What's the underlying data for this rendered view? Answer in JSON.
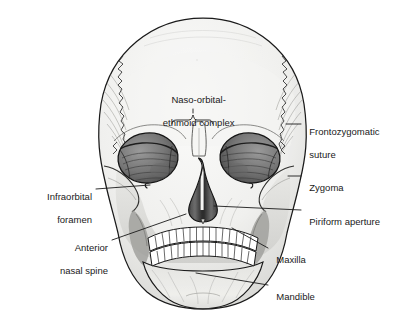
{
  "figure": {
    "style": "greyscale pen-and-ink medical illustration",
    "background_color": "#ffffff",
    "ink_color": "#1a1a1a",
    "palette": {
      "cranium_fill": "#f2f2f0",
      "midface_fill": "#dcdcda",
      "shadow_fill": "#b8b8b6",
      "orbit_fill": "#7d7d7d",
      "orbit_deep": "#4a4a4a",
      "nasal_aperture_fill": "#3f3f3f",
      "tooth_fill": "#ffffff",
      "outline": "#1a1a1a",
      "leader_line": "#1a1a1a"
    }
  },
  "labels": [
    {
      "id": "naso-orbital-ethmoid-complex",
      "text_line1": "Naso-orbital-",
      "text_line2": "ethmoid complex",
      "side": "top",
      "align": "c",
      "x": 196,
      "y": 88,
      "pointer": "curly-brace",
      "brace": {
        "x1": 172,
        "x2": 213,
        "y": 122,
        "stem_y": 115
      }
    },
    {
      "id": "frontozygomatic-suture",
      "text_line1": "Frontozygomatic",
      "text_line2": "suture",
      "side": "right",
      "align": "r",
      "x": 305,
      "y": 120,
      "leader": {
        "x1": 286,
        "y1": 124,
        "x2": 301,
        "y2": 124
      }
    },
    {
      "id": "zygoma",
      "text_line1": "Zygoma",
      "text_line2": "",
      "side": "right",
      "align": "r",
      "x": 305,
      "y": 172,
      "leader": {
        "x1": 288,
        "y1": 176,
        "x2": 301,
        "y2": 176
      }
    },
    {
      "id": "piriform-aperture",
      "text_line1": "Piriform aperture",
      "text_line2": "",
      "side": "right",
      "align": "r",
      "x": 305,
      "y": 206,
      "leader": {
        "x1": 214,
        "y1": 206,
        "x2": 301,
        "y2": 210
      }
    },
    {
      "id": "maxilla",
      "text_line1": "Maxilla",
      "text_line2": "",
      "side": "right",
      "align": "r",
      "x": 272,
      "y": 244,
      "leader": {
        "x1": 232,
        "y1": 228,
        "x2": 268,
        "y2": 248
      }
    },
    {
      "id": "mandible",
      "text_line1": "Mandible",
      "text_line2": "",
      "side": "right",
      "align": "r",
      "x": 272,
      "y": 281,
      "leader": {
        "x1": 196,
        "y1": 273,
        "x2": 268,
        "y2": 285
      }
    },
    {
      "id": "infraorbital-foramen",
      "text_line1": "Infraorbital",
      "text_line2": "foramen",
      "side": "left",
      "align": "l",
      "x": 92,
      "y": 185,
      "leader": {
        "x1": 96,
        "y1": 189,
        "x2": 150,
        "y2": 185
      }
    },
    {
      "id": "anterior-nasal-spine",
      "text_line1": "Anterior",
      "text_line2": "nasal spine",
      "side": "left",
      "align": "l",
      "x": 108,
      "y": 236,
      "leader": {
        "x1": 112,
        "y1": 240,
        "x2": 186,
        "y2": 214
      }
    }
  ],
  "anatomy": {
    "regions": [
      "cranial-vault",
      "coronal-suture-left",
      "coronal-suture-right",
      "frontal-bone",
      "supraorbital-ridge",
      "orbit-left",
      "orbit-right",
      "nasal-bridge",
      "piriform-aperture",
      "zygoma-left",
      "zygoma-right",
      "maxilla",
      "mandible",
      "upper-teeth",
      "lower-teeth"
    ],
    "upper_teeth_count": 16,
    "lower_teeth_count": 16
  }
}
